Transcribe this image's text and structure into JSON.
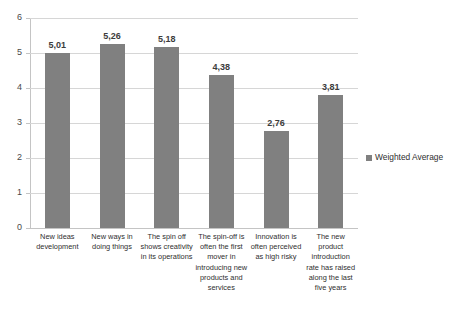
{
  "top_caption_remnant": "",
  "chart_data": {
    "type": "bar",
    "title": "",
    "xlabel": "",
    "ylabel": "",
    "ylim": [
      0,
      6
    ],
    "ytick_labels": [
      "6",
      "5",
      "4",
      "3",
      "2",
      "1",
      "0"
    ],
    "yticks": [
      6,
      5,
      4,
      3,
      2,
      1,
      0
    ],
    "grid": true,
    "legend_position": "right",
    "series": [
      {
        "name": "Weighted Average",
        "color": "#808080",
        "values": [
          5.01,
          5.26,
          5.18,
          4.38,
          2.76,
          3.81
        ],
        "value_labels": [
          "5,01",
          "5,26",
          "5,18",
          "4,38",
          "2,76",
          "3,81"
        ]
      }
    ],
    "categories": [
      "New ideas development",
      "New ways in doing things",
      "The spin off shows creativity in its operations",
      "The spin-off is often the first mover in introducing new products and services",
      "Innovation is often perceived as high risky",
      "The new product introduction rate has raised along the last five years"
    ]
  },
  "legend": {
    "label": "Weighted Average"
  }
}
